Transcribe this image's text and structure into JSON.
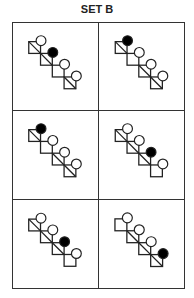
{
  "title": "SET B",
  "colors": {
    "line": "#222222",
    "filled": "#000000",
    "open": "#ffffff"
  },
  "cells": [
    {
      "diagonals": [
        true,
        true,
        false,
        true
      ],
      "circles": [
        "open",
        "filled",
        "open",
        "open"
      ]
    },
    {
      "diagonals": [
        true,
        false,
        true,
        true
      ],
      "circles": [
        "filled",
        "open",
        "open",
        "open"
      ]
    },
    {
      "diagonals": [
        true,
        false,
        true,
        true
      ],
      "circles": [
        "filled",
        "open",
        "open",
        "open"
      ]
    },
    {
      "diagonals": [
        true,
        true,
        true,
        false
      ],
      "circles": [
        "open",
        "open",
        "filled",
        "open"
      ]
    },
    {
      "diagonals": [
        true,
        true,
        true,
        false
      ],
      "circles": [
        "open",
        "open",
        "filled",
        "open"
      ]
    },
    {
      "diagonals": [
        false,
        true,
        true,
        true
      ],
      "circles": [
        "open",
        "open",
        "open",
        "filled"
      ]
    }
  ]
}
